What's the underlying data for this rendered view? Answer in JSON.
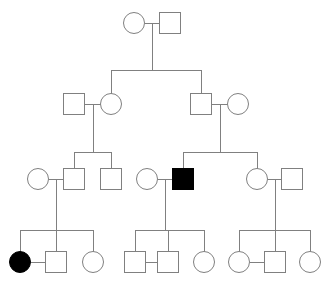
{
  "chart_data": {
    "type": "diagram",
    "diagram_kind": "pedigree",
    "generations": 4,
    "symbol_legend": {
      "square": "male",
      "circle": "female",
      "filled": "affected",
      "open": "unaffected"
    },
    "geometry": {
      "canvas_width": 330,
      "canvas_height": 282,
      "symbol_size": 21,
      "line_color": "#808080",
      "fill_unaffected": "#ffffff",
      "fill_affected": "#000000",
      "generation_y": [
        23,
        104,
        179,
        262
      ]
    },
    "individuals": [
      {
        "id": "I-1",
        "generation": 1,
        "sex": "female",
        "affected": false,
        "shape": "circle",
        "cx": 134,
        "cy": 23
      },
      {
        "id": "I-2",
        "generation": 1,
        "sex": "male",
        "affected": false,
        "shape": "square",
        "cx": 170,
        "cy": 23
      },
      {
        "id": "II-1",
        "generation": 2,
        "sex": "male",
        "affected": false,
        "shape": "square",
        "cx": 74,
        "cy": 104
      },
      {
        "id": "II-2",
        "generation": 2,
        "sex": "female",
        "affected": false,
        "shape": "circle",
        "cx": 111,
        "cy": 104
      },
      {
        "id": "II-3",
        "generation": 2,
        "sex": "male",
        "affected": false,
        "shape": "square",
        "cx": 201,
        "cy": 104
      },
      {
        "id": "II-4",
        "generation": 2,
        "sex": "female",
        "affected": false,
        "shape": "circle",
        "cx": 238,
        "cy": 104
      },
      {
        "id": "III-1",
        "generation": 3,
        "sex": "female",
        "affected": false,
        "shape": "circle",
        "cx": 38,
        "cy": 179
      },
      {
        "id": "III-2",
        "generation": 3,
        "sex": "male",
        "affected": false,
        "shape": "square",
        "cx": 74,
        "cy": 179
      },
      {
        "id": "III-3",
        "generation": 3,
        "sex": "male",
        "affected": false,
        "shape": "square",
        "cx": 111,
        "cy": 179
      },
      {
        "id": "III-4",
        "generation": 3,
        "sex": "female",
        "affected": false,
        "shape": "circle",
        "cx": 147,
        "cy": 179
      },
      {
        "id": "III-5",
        "generation": 3,
        "sex": "male",
        "affected": true,
        "shape": "square",
        "cx": 183,
        "cy": 179
      },
      {
        "id": "III-6",
        "generation": 3,
        "sex": "female",
        "affected": false,
        "shape": "circle",
        "cx": 257,
        "cy": 179
      },
      {
        "id": "III-7",
        "generation": 3,
        "sex": "male",
        "affected": false,
        "shape": "square",
        "cx": 292,
        "cy": 179
      },
      {
        "id": "IV-1",
        "generation": 4,
        "sex": "female",
        "affected": true,
        "shape": "circle",
        "cx": 20,
        "cy": 262
      },
      {
        "id": "IV-2",
        "generation": 4,
        "sex": "male",
        "affected": false,
        "shape": "square",
        "cx": 56,
        "cy": 262
      },
      {
        "id": "IV-3",
        "generation": 4,
        "sex": "female",
        "affected": false,
        "shape": "circle",
        "cx": 93,
        "cy": 262
      },
      {
        "id": "IV-4",
        "generation": 4,
        "sex": "male",
        "affected": false,
        "shape": "square",
        "cx": 135,
        "cy": 262
      },
      {
        "id": "IV-5",
        "generation": 4,
        "sex": "male",
        "affected": false,
        "shape": "square",
        "cx": 168,
        "cy": 262
      },
      {
        "id": "IV-6",
        "generation": 4,
        "sex": "female",
        "affected": false,
        "shape": "circle",
        "cx": 204,
        "cy": 262
      },
      {
        "id": "IV-7",
        "generation": 4,
        "sex": "female",
        "affected": false,
        "shape": "circle",
        "cx": 239,
        "cy": 262
      },
      {
        "id": "IV-8",
        "generation": 4,
        "sex": "male",
        "affected": false,
        "shape": "square",
        "cx": 275,
        "cy": 262
      },
      {
        "id": "IV-9",
        "generation": 4,
        "sex": "female",
        "affected": false,
        "shape": "circle",
        "cx": 310,
        "cy": 262
      }
    ],
    "matings": [
      {
        "id": "M1",
        "partners": [
          "I-1",
          "I-2"
        ],
        "mate_line_y": 23,
        "children": [
          "II-2",
          "II-3"
        ],
        "sibship_y": 70,
        "drop_x": 152
      },
      {
        "id": "M2",
        "partners": [
          "II-1",
          "II-2"
        ],
        "mate_line_y": 104,
        "children": [
          "III-2",
          "III-3"
        ],
        "sibship_y": 152,
        "drop_x": 93
      },
      {
        "id": "M3",
        "partners": [
          "II-3",
          "II-4"
        ],
        "mate_line_y": 104,
        "children": [
          "III-5",
          "III-6"
        ],
        "sibship_y": 152,
        "drop_x": 220
      },
      {
        "id": "M4",
        "partners": [
          "III-1",
          "III-2"
        ],
        "mate_line_y": 179,
        "children": [
          "IV-1",
          "IV-2",
          "IV-3"
        ],
        "sibship_y": 230,
        "drop_x": 56
      },
      {
        "id": "M5",
        "partners": [
          "III-4",
          "III-5"
        ],
        "mate_line_y": 179,
        "children": [
          "IV-4",
          "IV-5",
          "IV-6"
        ],
        "sibship_y": 230,
        "drop_x": 165
      },
      {
        "id": "M6",
        "partners": [
          "III-6",
          "III-7"
        ],
        "mate_line_y": 179,
        "children": [
          "IV-7",
          "IV-8",
          "IV-9"
        ],
        "sibship_y": 230,
        "drop_x": 275
      },
      {
        "id": "M7",
        "partners": [
          "IV-1",
          "IV-2"
        ],
        "mate_line_y": 262,
        "children": [],
        "sibship_y": null,
        "drop_x": null
      },
      {
        "id": "M8",
        "partners": [
          "IV-4",
          "IV-5"
        ],
        "mate_line_y": 262,
        "children": [],
        "sibship_y": null,
        "drop_x": null
      },
      {
        "id": "M9",
        "partners": [
          "IV-7",
          "IV-8"
        ],
        "mate_line_y": 262,
        "children": [],
        "sibship_y": null,
        "drop_x": null
      }
    ],
    "affected_count": 2,
    "total_individuals": 22
  }
}
